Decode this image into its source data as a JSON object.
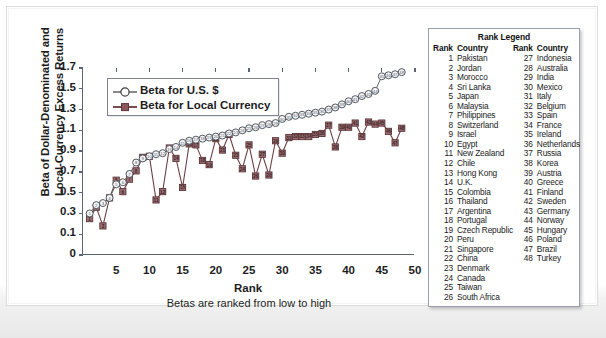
{
  "chart_data": {
    "type": "line",
    "title": "",
    "xlabel": "Rank",
    "xsublabel": "Betas are ranked from low to high",
    "ylabel_line1": "Beta of Dollar-Denominated and",
    "ylabel_line2": "Local-Currency Excess Returns",
    "xlim": [
      0,
      50
    ],
    "ylim": [
      0,
      1.7
    ],
    "xticks": [
      5,
      10,
      15,
      20,
      25,
      30,
      35,
      40,
      45,
      50
    ],
    "yticks": [
      "0",
      "0.1",
      "0.3",
      "0.5",
      "0.7",
      "0.9",
      "1.1",
      "1.3",
      "1.5",
      "1.7"
    ],
    "ytick_values": [
      0,
      0.1,
      0.3,
      0.5,
      0.7,
      0.9,
      1.1,
      1.3,
      1.5,
      1.7
    ],
    "grid": false,
    "legend_position": "top-left-inside",
    "x": [
      1,
      2,
      3,
      4,
      5,
      6,
      7,
      8,
      9,
      10,
      11,
      12,
      13,
      14,
      15,
      16,
      17,
      18,
      19,
      20,
      21,
      22,
      23,
      24,
      25,
      26,
      27,
      28,
      29,
      30,
      31,
      32,
      33,
      34,
      35,
      36,
      37,
      38,
      39,
      40,
      41,
      42,
      43,
      44,
      45,
      46,
      47,
      48
    ],
    "series": [
      {
        "name": "Beta for U.S. $",
        "marker": "open-circle",
        "color": "#4a4a4a",
        "values": [
          0.3,
          0.38,
          0.4,
          0.45,
          0.58,
          0.6,
          0.68,
          0.79,
          0.83,
          0.85,
          0.87,
          0.88,
          0.92,
          0.94,
          0.98,
          1.0,
          1.01,
          1.02,
          1.03,
          1.04,
          1.05,
          1.07,
          1.08,
          1.1,
          1.12,
          1.13,
          1.15,
          1.16,
          1.17,
          1.21,
          1.23,
          1.24,
          1.25,
          1.26,
          1.27,
          1.28,
          1.3,
          1.32,
          1.35,
          1.38,
          1.4,
          1.43,
          1.45,
          1.48,
          1.62,
          1.63,
          1.64,
          1.66
        ]
      },
      {
        "name": "Beta for Local Currency",
        "marker": "filled-square",
        "color": "#7a4b4f",
        "values": [
          0.25,
          0.36,
          0.18,
          0.45,
          0.62,
          0.51,
          0.63,
          0.71,
          0.84,
          0.85,
          0.43,
          0.51,
          0.93,
          0.83,
          0.55,
          0.97,
          0.96,
          0.81,
          0.77,
          1.02,
          0.91,
          1.06,
          0.86,
          0.73,
          0.96,
          0.66,
          0.87,
          0.67,
          1.0,
          0.88,
          1.03,
          1.04,
          1.04,
          1.04,
          1.06,
          1.07,
          1.15,
          0.94,
          1.13,
          1.13,
          1.17,
          1.04,
          1.18,
          1.16,
          1.17,
          1.09,
          0.98,
          1.12
        ]
      }
    ]
  },
  "series_legend": {
    "items": [
      {
        "label": "Beta for U.S. $",
        "marker": "open-circle"
      },
      {
        "label": "Beta for Local Currency",
        "marker": "filled-square"
      }
    ]
  },
  "rank_legend": {
    "title": "Rank Legend",
    "headers": {
      "rank": "Rank",
      "country": "Country"
    },
    "left_column": [
      {
        "rank": "1",
        "country": "Pakistan"
      },
      {
        "rank": "2",
        "country": "Jordan"
      },
      {
        "rank": "3",
        "country": "Morocco"
      },
      {
        "rank": "4",
        "country": "Sri Lanka"
      },
      {
        "rank": "5",
        "country": "Japan"
      },
      {
        "rank": "6",
        "country": "Malaysia"
      },
      {
        "rank": "7",
        "country": "Philippines"
      },
      {
        "rank": "8",
        "country": "Switzerland"
      },
      {
        "rank": "9",
        "country": "Israel"
      },
      {
        "rank": "10",
        "country": "Egypt"
      },
      {
        "rank": "11",
        "country": "New Zealand"
      },
      {
        "rank": "12",
        "country": "Chile"
      },
      {
        "rank": "13",
        "country": "Hong Kong"
      },
      {
        "rank": "14",
        "country": "U.K."
      },
      {
        "rank": "15",
        "country": "Colombia"
      },
      {
        "rank": "16",
        "country": "Thailand"
      },
      {
        "rank": "17",
        "country": "Argentina"
      },
      {
        "rank": "18",
        "country": "Portugal"
      },
      {
        "rank": "19",
        "country": "Czech Republic"
      },
      {
        "rank": "20",
        "country": "Peru"
      },
      {
        "rank": "21",
        "country": "Singapore"
      },
      {
        "rank": "22",
        "country": "China"
      },
      {
        "rank": "23",
        "country": "Denmark"
      },
      {
        "rank": "24",
        "country": "Canada"
      },
      {
        "rank": "25",
        "country": "Taiwan"
      },
      {
        "rank": "26",
        "country": "South Africa"
      }
    ],
    "right_column": [
      {
        "rank": "27",
        "country": "Indonesia"
      },
      {
        "rank": "28",
        "country": "Australia"
      },
      {
        "rank": "29",
        "country": "India"
      },
      {
        "rank": "30",
        "country": "Mexico"
      },
      {
        "rank": "31",
        "country": "Italy"
      },
      {
        "rank": "32",
        "country": "Belgium"
      },
      {
        "rank": "33",
        "country": "Spain"
      },
      {
        "rank": "34",
        "country": "France"
      },
      {
        "rank": "35",
        "country": "Ireland"
      },
      {
        "rank": "36",
        "country": "Netherlands"
      },
      {
        "rank": "37",
        "country": "Russia"
      },
      {
        "rank": "38",
        "country": "Korea"
      },
      {
        "rank": "39",
        "country": "Austria"
      },
      {
        "rank": "40",
        "country": "Greece"
      },
      {
        "rank": "41",
        "country": "Finland"
      },
      {
        "rank": "42",
        "country": "Sweden"
      },
      {
        "rank": "43",
        "country": "Germany"
      },
      {
        "rank": "44",
        "country": "Norway"
      },
      {
        "rank": "45",
        "country": "Hungary"
      },
      {
        "rank": "46",
        "country": "Poland"
      },
      {
        "rank": "47",
        "country": "Brazil"
      },
      {
        "rank": "48",
        "country": "Turkey"
      },
      {
        "rank": "",
        "country": ""
      },
      {
        "rank": "",
        "country": ""
      },
      {
        "rank": "",
        "country": ""
      },
      {
        "rank": "",
        "country": ""
      }
    ]
  },
  "colors": {
    "usd_series": "#4a4a4a",
    "local_series": "#7a4b4f",
    "axis": "#5a6472",
    "frame": "#dcdcdc"
  }
}
